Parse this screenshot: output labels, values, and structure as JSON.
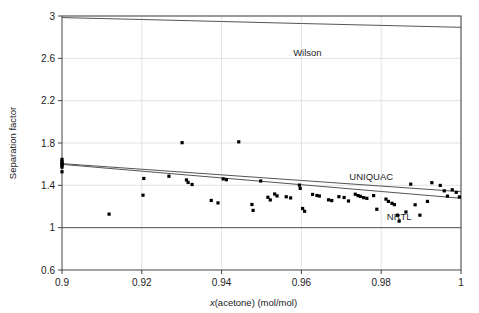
{
  "chart_data": {
    "type": "scatter",
    "title": "",
    "xlabel": "x(acetone) (mol/mol)",
    "xlabel_italic_prefix": "x",
    "xlabel_rest": "(acetone) (mol/mol)",
    "ylabel": "Separation factor",
    "xlim": [
      0.9,
      1.0
    ],
    "ylim": [
      0.6,
      3.0
    ],
    "xticks": [
      0.9,
      0.92,
      0.94,
      0.96,
      0.98,
      1
    ],
    "xtick_labels": [
      "0.9",
      "0.92",
      "0.94",
      "0.96",
      "0.98",
      "1"
    ],
    "yticks": [
      0.6,
      1,
      1.4,
      1.8,
      2.2,
      2.6,
      3
    ],
    "ytick_labels": [
      "0.6",
      "1",
      "1.4",
      "1.8",
      "2.2",
      "2.6",
      "3"
    ],
    "grid": true,
    "legend_position": "inline-annotations",
    "colors": {
      "line": "#555555",
      "marker": "#000000",
      "grid": "#e2e2e2",
      "axis": "#444444",
      "text": "#1a1a1a"
    },
    "series": [
      {
        "name": "Wilson",
        "type": "line",
        "label": "Wilson",
        "label_x": 0.9615,
        "label_y": 2.62,
        "x": [
          0.9,
          0.92,
          0.94,
          0.96,
          0.98,
          1.0
        ],
        "values": [
          2.985,
          2.967,
          2.948,
          2.929,
          2.911,
          2.893
        ]
      },
      {
        "name": "UNIQUAC",
        "type": "line",
        "label": "UNIQUAC",
        "label_x": 0.9775,
        "label_y": 1.455,
        "x": [
          0.9,
          0.92,
          0.94,
          0.96,
          0.98,
          1.0
        ],
        "values": [
          1.605,
          1.552,
          1.499,
          1.446,
          1.393,
          1.34
        ]
      },
      {
        "name": "UNIQUAC-2",
        "type": "line",
        "label": "",
        "x": [
          0.9,
          0.92,
          0.94,
          0.96,
          0.98,
          1.0
        ],
        "values": [
          1.598,
          1.534,
          1.47,
          1.406,
          1.342,
          1.278
        ]
      },
      {
        "name": "NRTL",
        "type": "line",
        "label": "NRTL",
        "label_x": 0.9845,
        "label_y": 1.075,
        "x": [
          0.9,
          1.0
        ],
        "values": [
          1.0,
          1.0
        ]
      },
      {
        "name": "experimental",
        "type": "scatter",
        "label": "",
        "points": [
          [
            0.9,
            1.645
          ],
          [
            0.9,
            1.625
          ],
          [
            0.9,
            1.612
          ],
          [
            0.9,
            1.6
          ],
          [
            0.9,
            1.588
          ],
          [
            0.9,
            1.572
          ],
          [
            0.9,
            1.528
          ],
          [
            0.9118,
            1.128
          ],
          [
            0.9205,
            1.465
          ],
          [
            0.9203,
            1.307
          ],
          [
            0.9268,
            1.486
          ],
          [
            0.9301,
            1.803
          ],
          [
            0.9312,
            1.451
          ],
          [
            0.9316,
            1.427
          ],
          [
            0.9326,
            1.408
          ],
          [
            0.9374,
            1.257
          ],
          [
            0.9391,
            1.234
          ],
          [
            0.9404,
            1.461
          ],
          [
            0.9412,
            1.453
          ],
          [
            0.9443,
            1.811
          ],
          [
            0.9476,
            1.219
          ],
          [
            0.9479,
            1.163
          ],
          [
            0.9498,
            1.441
          ],
          [
            0.9516,
            1.287
          ],
          [
            0.9522,
            1.262
          ],
          [
            0.9533,
            1.318
          ],
          [
            0.9539,
            1.3
          ],
          [
            0.9562,
            1.292
          ],
          [
            0.9573,
            1.281
          ],
          [
            0.9595,
            1.402
          ],
          [
            0.9597,
            1.371
          ],
          [
            0.9603,
            1.181
          ],
          [
            0.9608,
            1.155
          ],
          [
            0.9628,
            1.314
          ],
          [
            0.9639,
            1.304
          ],
          [
            0.9645,
            1.299
          ],
          [
            0.9668,
            1.263
          ],
          [
            0.9676,
            1.256
          ],
          [
            0.9694,
            1.293
          ],
          [
            0.9707,
            1.285
          ],
          [
            0.9718,
            1.252
          ],
          [
            0.9735,
            1.316
          ],
          [
            0.9742,
            1.303
          ],
          [
            0.9748,
            1.296
          ],
          [
            0.9756,
            1.284
          ],
          [
            0.9764,
            1.277
          ],
          [
            0.9781,
            1.303
          ],
          [
            0.9789,
            1.174
          ],
          [
            0.9812,
            1.27
          ],
          [
            0.9818,
            1.248
          ],
          [
            0.9827,
            1.23
          ],
          [
            0.9833,
            1.218
          ],
          [
            0.9841,
            1.118
          ],
          [
            0.9845,
            1.062
          ],
          [
            0.9862,
            1.148
          ],
          [
            0.9874,
            1.411
          ],
          [
            0.9885,
            1.216
          ],
          [
            0.9897,
            1.118
          ],
          [
            0.9916,
            1.248
          ],
          [
            0.9927,
            1.425
          ],
          [
            0.9948,
            1.399
          ],
          [
            0.9958,
            1.348
          ],
          [
            0.9966,
            1.298
          ],
          [
            0.9978,
            1.358
          ],
          [
            0.9988,
            1.334
          ],
          [
            0.9996,
            1.29
          ]
        ]
      }
    ]
  }
}
